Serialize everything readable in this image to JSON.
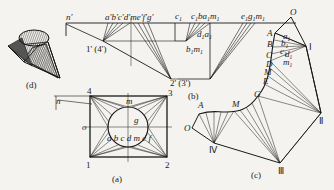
{
  "figure": {
    "colors": {
      "background": "#f4f3ef",
      "ink": "#1a1a1a",
      "hatch": "#333333"
    }
  },
  "panels": {
    "d": {
      "caption": "(d)",
      "description": "3D view of square-to-round transition piece"
    },
    "b": {
      "caption": "(b)",
      "labels": {
        "n": "n'",
        "top_points": "a'b'c'd'me'f'g'",
        "p1": "1' (4')",
        "p2": "2' (3')",
        "c1": "c",
        "c1_sub": "1",
        "c1b": "c",
        "c1b_sub": "1",
        "b": "b",
        "a1": "a",
        "a1_sub": "1",
        "m1": "m",
        "m1_sub": "1",
        "d1": "d",
        "d1_sub": "1",
        "a1b": "a",
        "a1b_sub": "1",
        "b1": "b",
        "b1_sub": "1",
        "m1b": "m",
        "m1b_sub": "1",
        "e1": "e",
        "e1_sub": "1",
        "g1": "g",
        "g1_sub": "1",
        "m1c": "m",
        "m1c_sub": "1"
      }
    },
    "a": {
      "caption": "(a)",
      "labels": {
        "n": "n",
        "o": "o",
        "m": "m",
        "g": "g",
        "circle_points": "a b c d m e f",
        "c1": "1",
        "c2": "2",
        "c3": "3",
        "c4": "4"
      }
    },
    "c": {
      "caption": "(c)",
      "labels": {
        "O_top": "O",
        "A": "A",
        "B": "B",
        "C": "C",
        "D": "D",
        "M": "M",
        "E": "E",
        "G": "G",
        "a1": "a",
        "b1": "b",
        "c1": "c",
        "d1": "d",
        "m1": "m",
        "sub": "1",
        "I": "Ⅰ",
        "II": "Ⅱ",
        "III": "Ⅲ",
        "IV": "Ⅳ",
        "A_low": "A",
        "M_low": "M",
        "O_low": "O"
      }
    }
  }
}
